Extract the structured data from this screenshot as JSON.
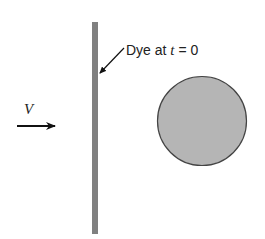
{
  "diagram": {
    "dye_label_prefix": "Dye at ",
    "dye_label_var": "t",
    "dye_label_suffix": " = 0",
    "velocity_label": "V",
    "colors": {
      "dye_line": "#808080",
      "cylinder_fill": "#b5b5b5",
      "cylinder_stroke": "#444444",
      "arrow": "#111111"
    }
  }
}
